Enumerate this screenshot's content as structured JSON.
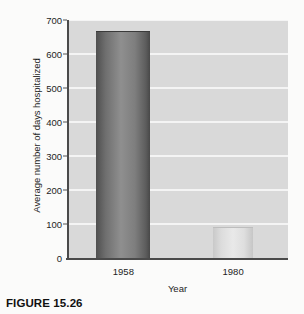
{
  "caption": "FIGURE 15.26",
  "chart_data": {
    "type": "bar",
    "title": "",
    "xlabel": "Year",
    "ylabel": "Average number of days hospitalized",
    "categories": [
      "1958",
      "1980"
    ],
    "values": [
      665,
      88
    ],
    "ylim": [
      0,
      700
    ],
    "yticks": [
      0,
      100,
      200,
      300,
      400,
      500,
      600,
      700
    ],
    "ytick_labels": [
      "0",
      "100",
      "200",
      "300",
      "400",
      "500",
      "600",
      "700"
    ],
    "grid": true,
    "legend": "none",
    "series": [
      {
        "name": "Average number of days hospitalized",
        "values": [
          665,
          88
        ]
      }
    ],
    "colors": {
      "plot_background": "#d9d9d9",
      "gridline": "#f4f4f4",
      "axis": "#4a4a4a",
      "bar_1958": "#6f6f6f",
      "bar_1980": "#dcdcdc",
      "text": "#1d1d1d",
      "page_background": "#fbfbfa"
    }
  }
}
